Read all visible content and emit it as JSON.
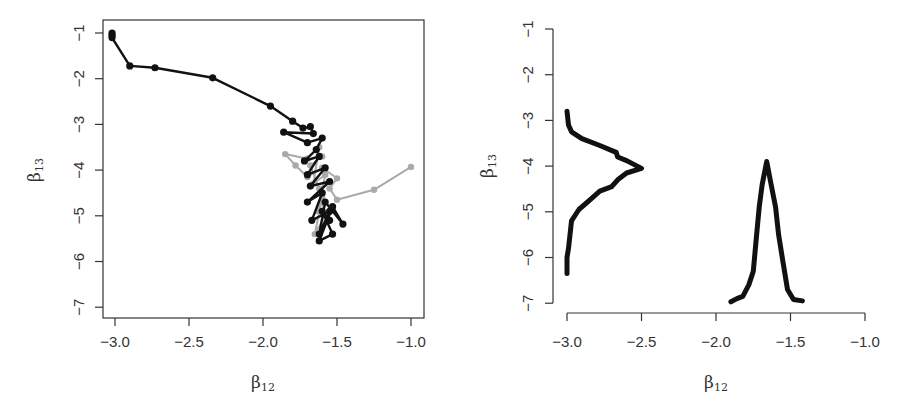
{
  "chart_data": [
    {
      "type": "line",
      "subtype": "trace-plot (MCMC chains in parameter space)",
      "title": "",
      "xlabel": "β12",
      "ylabel": "β13",
      "xlim": [
        -3.05,
        -0.92
      ],
      "ylim": [
        -7.1,
        -0.85
      ],
      "xticks": [
        "-3.0",
        "-2.5",
        "-2.0",
        "-1.5",
        "-1.0"
      ],
      "xtick_values": [
        -3.0,
        -2.5,
        -2.0,
        -1.5,
        -1.0
      ],
      "yticks": [
        "-1",
        "-2",
        "-3",
        "-4",
        "-5",
        "-6",
        "-7"
      ],
      "ytick_values": [
        -1,
        -2,
        -3,
        -4,
        -5,
        -6,
        -7
      ],
      "grid": false,
      "box": true,
      "series": [
        {
          "name": "chain-black",
          "color": "#111111",
          "points": [
            [
              -3.02,
              -1.0
            ],
            [
              -3.02,
              -1.05
            ],
            [
              -3.02,
              -1.1
            ],
            [
              -2.9,
              -1.72
            ],
            [
              -2.73,
              -1.76
            ],
            [
              -2.34,
              -1.98
            ],
            [
              -1.95,
              -2.6
            ],
            [
              -1.8,
              -2.93
            ],
            [
              -1.73,
              -3.08
            ],
            [
              -1.68,
              -3.05
            ],
            [
              -1.66,
              -3.2
            ],
            [
              -1.86,
              -3.17
            ],
            [
              -1.7,
              -3.4
            ],
            [
              -1.6,
              -3.3
            ],
            [
              -1.64,
              -3.55
            ],
            [
              -1.72,
              -3.8
            ],
            [
              -1.62,
              -3.7
            ],
            [
              -1.7,
              -4.1
            ],
            [
              -1.58,
              -3.95
            ],
            [
              -1.68,
              -4.35
            ],
            [
              -1.55,
              -4.25
            ],
            [
              -1.7,
              -4.7
            ],
            [
              -1.6,
              -4.5
            ],
            [
              -1.67,
              -5.1
            ],
            [
              -1.55,
              -4.9
            ],
            [
              -1.62,
              -5.4
            ],
            [
              -1.58,
              -4.7
            ],
            [
              -1.46,
              -5.18
            ],
            [
              -1.53,
              -4.8
            ],
            [
              -1.62,
              -5.55
            ],
            [
              -1.53,
              -5.4
            ],
            [
              -1.6,
              -4.9
            ],
            [
              -1.55,
              -5.1
            ]
          ]
        },
        {
          "name": "chain-gray",
          "color": "#aaaaaa",
          "points": [
            [
              -1.0,
              -3.93
            ],
            [
              -1.25,
              -4.43
            ],
            [
              -1.5,
              -4.65
            ],
            [
              -1.55,
              -4.4
            ],
            [
              -1.5,
              -4.18
            ],
            [
              -1.6,
              -3.95
            ],
            [
              -1.7,
              -4.15
            ],
            [
              -1.78,
              -3.9
            ],
            [
              -1.85,
              -3.65
            ],
            [
              -1.7,
              -3.75
            ],
            [
              -1.62,
              -3.5
            ],
            [
              -1.66,
              -4.3
            ],
            [
              -1.58,
              -4.1
            ],
            [
              -1.63,
              -4.9
            ],
            [
              -1.6,
              -4.6
            ],
            [
              -1.65,
              -5.4
            ],
            [
              -1.58,
              -5.0
            ],
            [
              -1.62,
              -4.4
            ],
            [
              -1.68,
              -3.9
            ],
            [
              -1.6,
              -3.7
            ]
          ]
        }
      ]
    },
    {
      "type": "line",
      "subtype": "marginal posterior densities",
      "title": "",
      "xlabel": "β12",
      "ylabel": "β13",
      "xlim": [
        -3.0,
        -1.0
      ],
      "ylim": [
        -7,
        -1
      ],
      "xticks": [
        "-3.0",
        "-2.5",
        "-2.0",
        "-1.5",
        "-1.0"
      ],
      "xtick_values": [
        -3.0,
        -2.5,
        -2.0,
        -1.5,
        -1.0
      ],
      "yticks": [
        "-1",
        "-2",
        "-3",
        "-4",
        "-5",
        "-6",
        "-7"
      ],
      "ytick_values": [
        -1,
        -2,
        -3,
        -4,
        -5,
        -6,
        -7
      ],
      "grid": false,
      "box": false,
      "series": [
        {
          "name": "density-beta13 (vertical, drawn from x=-3.0 baseline)",
          "color": "#111111",
          "points_x_y": [
            [
              -3.0,
              -2.8
            ],
            [
              -2.99,
              -3.1
            ],
            [
              -2.97,
              -3.25
            ],
            [
              -2.9,
              -3.4
            ],
            [
              -2.78,
              -3.55
            ],
            [
              -2.67,
              -3.7
            ],
            [
              -2.66,
              -3.8
            ],
            [
              -2.6,
              -3.88
            ],
            [
              -2.5,
              -4.05
            ],
            [
              -2.6,
              -4.15
            ],
            [
              -2.66,
              -4.3
            ],
            [
              -2.7,
              -4.45
            ],
            [
              -2.78,
              -4.55
            ],
            [
              -2.85,
              -4.75
            ],
            [
              -2.92,
              -4.95
            ],
            [
              -2.97,
              -5.2
            ],
            [
              -2.98,
              -5.5
            ],
            [
              -2.99,
              -5.8
            ],
            [
              -3.0,
              -6.0
            ],
            [
              -3.0,
              -6.35
            ]
          ]
        },
        {
          "name": "density-beta12 (horizontal, drawn from y=-7 baseline)",
          "color": "#111111",
          "points_x_y": [
            [
              -1.9,
              -6.97
            ],
            [
              -1.86,
              -6.9
            ],
            [
              -1.82,
              -6.85
            ],
            [
              -1.78,
              -6.6
            ],
            [
              -1.75,
              -6.3
            ],
            [
              -1.73,
              -5.6
            ],
            [
              -1.71,
              -4.9
            ],
            [
              -1.69,
              -4.4
            ],
            [
              -1.66,
              -3.9
            ],
            [
              -1.63,
              -4.4
            ],
            [
              -1.6,
              -4.9
            ],
            [
              -1.58,
              -5.5
            ],
            [
              -1.55,
              -6.1
            ],
            [
              -1.52,
              -6.7
            ],
            [
              -1.48,
              -6.92
            ],
            [
              -1.42,
              -6.95
            ]
          ]
        }
      ]
    }
  ],
  "labels": {
    "left": {
      "xlabel_main": "β",
      "xlabel_sub": "12",
      "ylabel_main": "β",
      "ylabel_sub": "13",
      "xticks": [
        "-3.0",
        "-2.5",
        "-2.0",
        "-1.5",
        "-1.0"
      ],
      "yticks": [
        "-1",
        "-2",
        "-3",
        "-4",
        "-5",
        "-6",
        "-7"
      ]
    },
    "right": {
      "xlabel_main": "β",
      "xlabel_sub": "12",
      "ylabel_main": "β",
      "ylabel_sub": "13",
      "xticks": [
        "-3.0",
        "-2.5",
        "-2.0",
        "-1.5",
        "-1.0"
      ],
      "yticks": [
        "-1",
        "-2",
        "-3",
        "-4",
        "-5",
        "-6",
        "-7"
      ]
    }
  }
}
